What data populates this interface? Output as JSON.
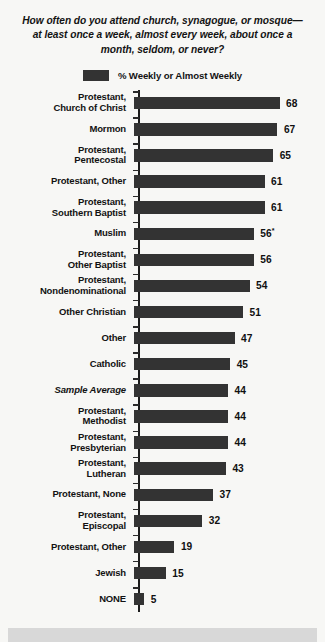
{
  "chart_data": {
    "type": "bar",
    "orientation": "horizontal",
    "title": "How often do you attend church, synagogue, or mosque—at least once a week, almost every week, about once a month, seldom, or never?",
    "legend": {
      "entries": [
        "% Weekly or Almost Weekly"
      ],
      "position": "top-center",
      "swatch_color": "#333333"
    },
    "xlabel": "",
    "ylabel": "",
    "xlim": [
      0,
      68
    ],
    "grid": false,
    "bar_color": "#333333",
    "categories": [
      "Protestant,\nChurch of Christ",
      "Mormon",
      "Protestant,\nPentecostal",
      "Protestant, Other",
      "Protestant,\nSouthern Baptist",
      "Muslim",
      "Protestant,\nOther Baptist",
      "Protestant,\nNondenominational",
      "Other Christian",
      "Other",
      "Catholic",
      "Sample Average",
      "Protestant,\nMethodist",
      "Protestant,\nPresbyterian",
      "Protestant,\nLutheran",
      "Protestant, None",
      "Protestant,\nEpiscopal",
      "Protestant, Other",
      "Jewish",
      "NONE"
    ],
    "values": [
      68,
      67,
      65,
      61,
      61,
      56,
      56,
      54,
      51,
      47,
      45,
      44,
      44,
      44,
      43,
      37,
      32,
      19,
      15,
      5
    ],
    "value_labels": [
      "68",
      "67",
      "65",
      "61",
      "61",
      "56",
      "56",
      "54",
      "51",
      "47",
      "45",
      "44",
      "44",
      "44",
      "43",
      "37",
      "32",
      "19",
      "15",
      "5"
    ],
    "annotations": [
      {
        "category": "Muslim",
        "marker": "*",
        "note": "asterisk appended to value label"
      }
    ],
    "emphasis": [
      {
        "category": "Sample Average",
        "style": "italic"
      }
    ]
  }
}
